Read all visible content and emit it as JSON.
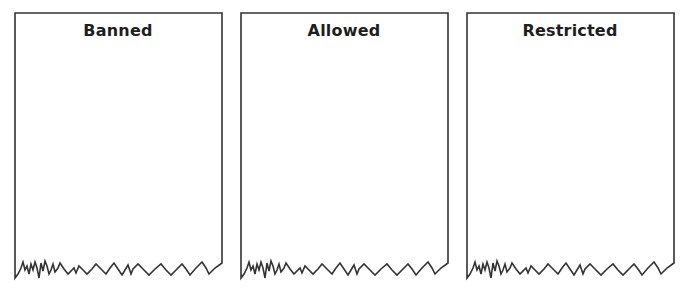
{
  "panels": [
    {
      "title": "Banned"
    },
    {
      "title": "Allowed"
    },
    {
      "title": "Restricted"
    }
  ],
  "style": {
    "border_color": "#333333",
    "background": "#ffffff"
  }
}
